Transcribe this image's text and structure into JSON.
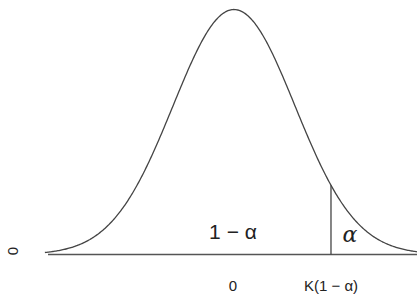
{
  "figure": {
    "colors": {
      "curve": "#444444",
      "axis": "#555555",
      "text": "#222222",
      "background": "#ffffff"
    },
    "region_labels": {
      "body": "1 − α",
      "tail": "α"
    },
    "x_ticks": {
      "center": "0",
      "critical": "K(1 − α)"
    },
    "y_label": "0"
  },
  "chart_data": {
    "type": "line",
    "title": "",
    "xlabel": "",
    "ylabel": "",
    "x_tick_labels": [
      "0",
      "K(1 − α)"
    ],
    "y_tick_labels": [
      "0"
    ],
    "series": [
      {
        "name": "density",
        "shape": "gaussian",
        "mean": 0,
        "sd": 1,
        "x_range": [
          -3.1,
          3.0
        ]
      }
    ],
    "annotations": [
      {
        "text": "1 − α",
        "position": "center under curve"
      },
      {
        "text": "α",
        "position": "right tail beyond K(1 − α)"
      },
      {
        "type": "vertical_line",
        "x": "K(1 − α)",
        "approx_sd": 1.59
      }
    ],
    "grid": false,
    "legend": null
  }
}
